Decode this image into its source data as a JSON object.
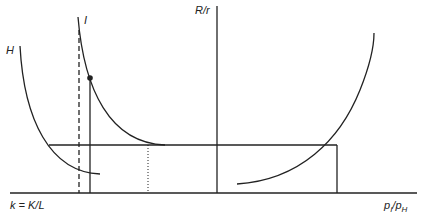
{
  "labels": {
    "y_axis": "R/r",
    "x_axis_left": "k = K/L",
    "x_axis_right_num": "p",
    "x_axis_right_num_sub": "I",
    "x_axis_right_den": "p",
    "x_axis_right_den_sub": "H",
    "curve_h": "H",
    "curve_i": "I"
  },
  "colors": {
    "line": "#222222",
    "background": "#ffffff"
  }
}
